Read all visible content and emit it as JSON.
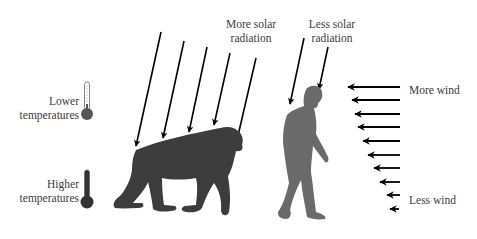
{
  "labels": {
    "more_solar": [
      "More solar",
      "radiation"
    ],
    "less_solar": [
      "Less solar",
      "radiation"
    ],
    "lower_temp": [
      "Lower",
      "temperatures"
    ],
    "higher_temp": [
      "Higher",
      "temperatures"
    ],
    "more_wind": "More wind",
    "less_wind": "Less wind"
  },
  "figures": {
    "quadruped": "chimpanzee-silhouette",
    "biped": "hominin-silhouette"
  },
  "colors": {
    "arrow": "#000000",
    "quadruped": "#3c3c3c",
    "biped": "#6a6a6a",
    "thermometer": "#555555",
    "text": "#3b3b3b"
  },
  "solar_arrows_quadruped": 5,
  "solar_arrows_biped": 2,
  "wind_arrows": 10
}
